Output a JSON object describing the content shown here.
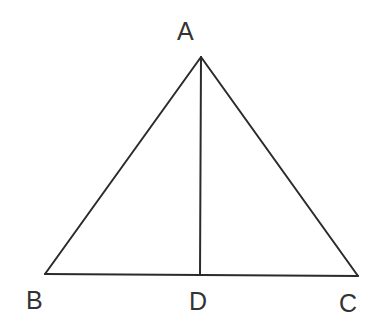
{
  "figure": {
    "kind": "geometry-diagram",
    "background_color": "#ffffff",
    "stroke_color": "#2b2b2b",
    "label_color": "#333333",
    "stroke_width": 2,
    "canvas": {
      "width": 371,
      "height": 330
    },
    "points": {
      "A": {
        "label": "A",
        "x": 201,
        "y": 57
      },
      "B": {
        "label": "B",
        "x": 45,
        "y": 274
      },
      "C": {
        "label": "C",
        "x": 358,
        "y": 276
      },
      "D": {
        "label": "D",
        "x": 200,
        "y": 275
      }
    },
    "segments": [
      {
        "name": "AB",
        "from": "A",
        "to": "B"
      },
      {
        "name": "AC",
        "from": "A",
        "to": "C"
      },
      {
        "name": "BC",
        "from": "B",
        "to": "C"
      },
      {
        "name": "AD",
        "from": "A",
        "to": "D"
      }
    ],
    "labels": {
      "A": "A",
      "B": "B",
      "C": "C",
      "D": "D"
    }
  }
}
